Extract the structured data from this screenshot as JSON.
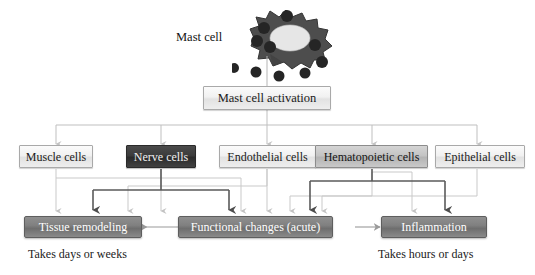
{
  "diagram": {
    "title_label": "Mast cell",
    "source": {
      "label": "Mast cell",
      "icon": "mast-cell-illustration"
    },
    "activation": {
      "label": "Mast cell activation"
    },
    "target_cells": [
      {
        "label": "Muscle cells",
        "style": "light"
      },
      {
        "label": "Nerve cells",
        "style": "dark"
      },
      {
        "label": "Endothelial cells",
        "style": "light"
      },
      {
        "label": "Hematopoietic cells",
        "style": "mid"
      },
      {
        "label": "Epithelial cells",
        "style": "light"
      }
    ],
    "outcomes": [
      {
        "label": "Tissue remodeling",
        "caption": "Takes days or weeks"
      },
      {
        "label": "Functional changes (acute)",
        "caption": ""
      },
      {
        "label": "Inflammation",
        "caption": "Takes hours or days"
      }
    ],
    "colors": {
      "light_box": "#eeeeee",
      "mid_box": "#c4c4c4",
      "dark_box": "#3c3c3c",
      "outcome_box": "#808080",
      "wire_light": "#c8c8c8",
      "wire_dark": "#555555",
      "cell_body": "#4e4e4e",
      "cell_nucleus": "#e3e3e3",
      "granule": "#2a2a2a"
    }
  }
}
